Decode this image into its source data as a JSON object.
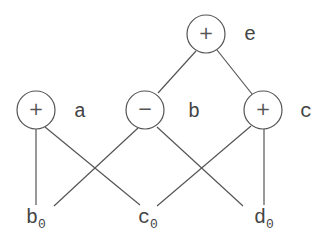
{
  "diagram": {
    "nodes": [
      {
        "id": "e",
        "op": "+",
        "label": "e"
      },
      {
        "id": "a",
        "op": "+",
        "label": "a"
      },
      {
        "id": "b",
        "op": "−",
        "label": "b"
      },
      {
        "id": "c",
        "op": "+",
        "label": "c"
      }
    ],
    "leaves": [
      {
        "id": "b0",
        "base": "b",
        "sub": "0"
      },
      {
        "id": "c0",
        "base": "c",
        "sub": "0"
      },
      {
        "id": "d0",
        "base": "d",
        "sub": "0"
      }
    ],
    "edges": [
      [
        "e",
        "b"
      ],
      [
        "e",
        "c"
      ],
      [
        "a",
        "b0"
      ],
      [
        "a",
        "c0"
      ],
      [
        "b",
        "b0"
      ],
      [
        "b",
        "d0"
      ],
      [
        "c",
        "c0"
      ],
      [
        "c",
        "d0"
      ]
    ]
  }
}
